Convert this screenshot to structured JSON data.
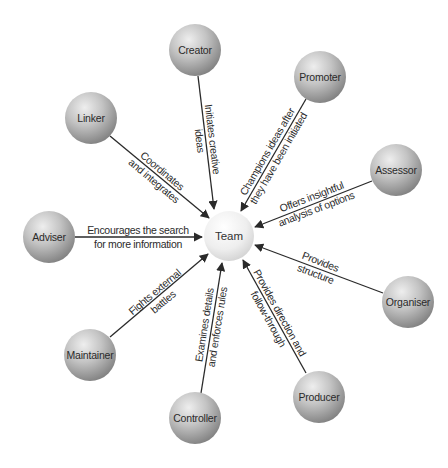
{
  "diagram": {
    "type": "radial-hub",
    "hub": {
      "id": "team",
      "label": "Team",
      "cx": 229,
      "cy": 236,
      "r": 25
    },
    "colors": {
      "node_light": "#e2e2e2",
      "node_dark": "#8a8a8a",
      "hub_light": "#ffffff",
      "hub_dark": "#d4d4d4",
      "line": "#2a2a2a",
      "text": "#2a2a2a"
    },
    "roles": [
      {
        "id": "creator",
        "label": "Creator",
        "cx": 195,
        "cy": 50,
        "description": [
          "Initiates creative",
          "ideas"
        ]
      },
      {
        "id": "promoter",
        "label": "Promoter",
        "cx": 320,
        "cy": 77,
        "description": [
          "Champions ideas after",
          "they have been initiated"
        ]
      },
      {
        "id": "assessor",
        "label": "Assessor",
        "cx": 396,
        "cy": 170,
        "description": [
          "Offers insightful",
          "analysis of options"
        ]
      },
      {
        "id": "organiser",
        "label": "Organiser",
        "cx": 408,
        "cy": 302,
        "description": [
          "Provides",
          "structure"
        ]
      },
      {
        "id": "producer",
        "label": "Producer",
        "cx": 319,
        "cy": 397,
        "description": [
          "Provides direction and",
          "follow-through"
        ]
      },
      {
        "id": "controller",
        "label": "Controller",
        "cx": 195,
        "cy": 418,
        "description": [
          "Examines details",
          "and enforces rules"
        ]
      },
      {
        "id": "maintainer",
        "label": "Maintainer",
        "cx": 90,
        "cy": 355,
        "description": [
          "Fights external",
          "battles"
        ]
      },
      {
        "id": "adviser",
        "label": "Adviser",
        "cx": 49,
        "cy": 237,
        "description": [
          "Encourages the search",
          "for more information"
        ]
      },
      {
        "id": "linker",
        "label": "Linker",
        "cx": 91,
        "cy": 118,
        "description": [
          "Coordinates",
          "and integrates"
        ]
      }
    ]
  }
}
